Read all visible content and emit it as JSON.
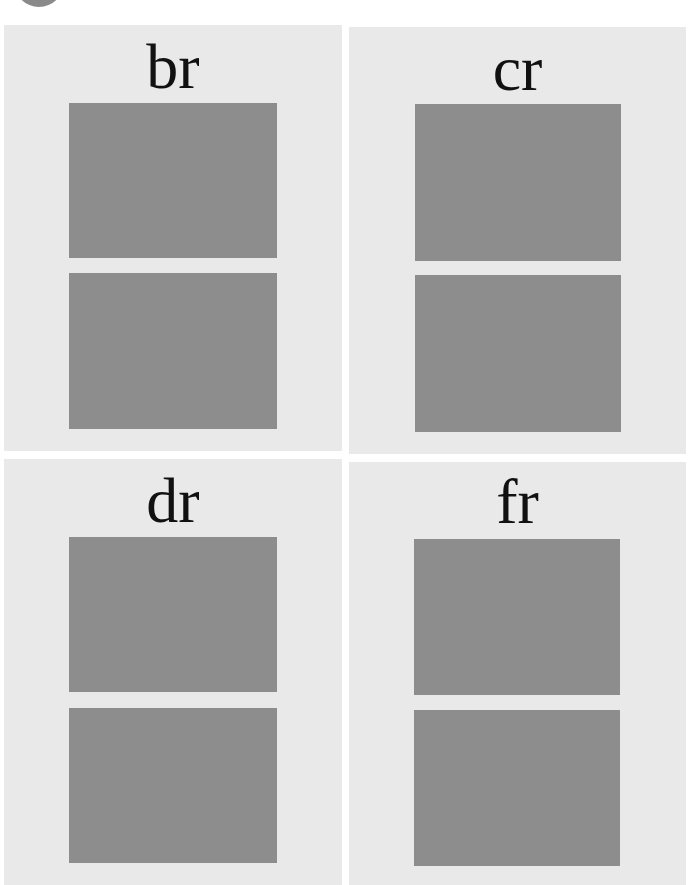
{
  "decorations": {
    "corner_circle_color": "#8a8a8a"
  },
  "colors": {
    "page_background": "#ffffff",
    "card_background": "#e9e9e9",
    "swatch": "#8d8d8d",
    "label_text": "#111111"
  },
  "cards": [
    {
      "label": "br",
      "swatches": 2
    },
    {
      "label": "cr",
      "swatches": 2
    },
    {
      "label": "dr",
      "swatches": 2
    },
    {
      "label": "fr",
      "swatches": 2
    }
  ]
}
